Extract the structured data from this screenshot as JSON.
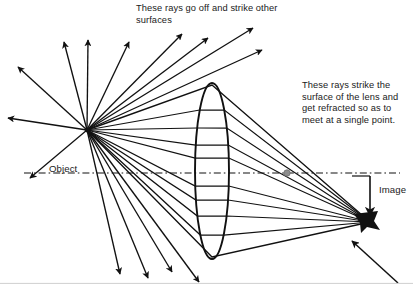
{
  "diagram": {
    "colors": {
      "ink": "#1a1a1a",
      "stroke": "#111111",
      "axis": "#111111",
      "focal_dot": "#8d8d8d",
      "background": "#ffffff"
    },
    "annotations": {
      "scatter_note": "These rays go off and strike other surfaces",
      "refract_note": "These rays strike the surface of the lens and get refracted so as to meet at a single point.",
      "object_label": "Object",
      "image_label": "Image"
    },
    "points": {
      "object": {
        "x": 87,
        "y": 130,
        "name": "object-point"
      },
      "image": {
        "x": 370,
        "y": 222,
        "name": "image-point"
      },
      "focal_dot": {
        "x": 287,
        "y": 173,
        "name": "focal-point-dot"
      }
    },
    "lens": {
      "cx": 212,
      "cy": 171,
      "rx": 17,
      "ry": 88,
      "name": "converging-lens"
    },
    "optical_axis": {
      "y": 173,
      "x1": 24,
      "x2": 400,
      "style": "dash-dot"
    },
    "scattered_rays": [
      {
        "x2": 18,
        "y2": 67
      },
      {
        "x2": 8,
        "y2": 118
      },
      {
        "x2": 30,
        "y2": 178
      },
      {
        "x2": 64,
        "y2": 42
      },
      {
        "x2": 88,
        "y2": 40
      },
      {
        "x2": 129,
        "y2": 42
      },
      {
        "x2": 182,
        "y2": 34
      },
      {
        "x2": 208,
        "y2": 38
      },
      {
        "x2": 253,
        "y2": 28
      },
      {
        "x2": 262,
        "y2": 50
      },
      {
        "x2": 120,
        "y2": 274
      },
      {
        "x2": 148,
        "y2": 278
      },
      {
        "x2": 172,
        "y2": 272
      },
      {
        "x2": 199,
        "y2": 282
      }
    ],
    "refracted_rays": [
      {
        "lens_y": 110
      },
      {
        "lens_y": 128
      },
      {
        "lens_y": 145
      },
      {
        "lens_y": 158
      },
      {
        "lens_y": 186
      },
      {
        "lens_y": 200
      },
      {
        "lens_y": 216
      },
      {
        "lens_y": 235
      }
    ],
    "edge_rays": [
      {
        "lens_y": 85
      },
      {
        "lens_y": 257
      }
    ],
    "image_pointer": {
      "from_x": 370,
      "from_y": 176,
      "to_x": 370,
      "to_y": 216,
      "name": "image-pointer-arrow"
    },
    "corner_pointer": {
      "from_x": 398,
      "from_y": 283,
      "to_x": 352,
      "to_y": 241,
      "name": "bottom-right-pointer-arrow"
    }
  }
}
